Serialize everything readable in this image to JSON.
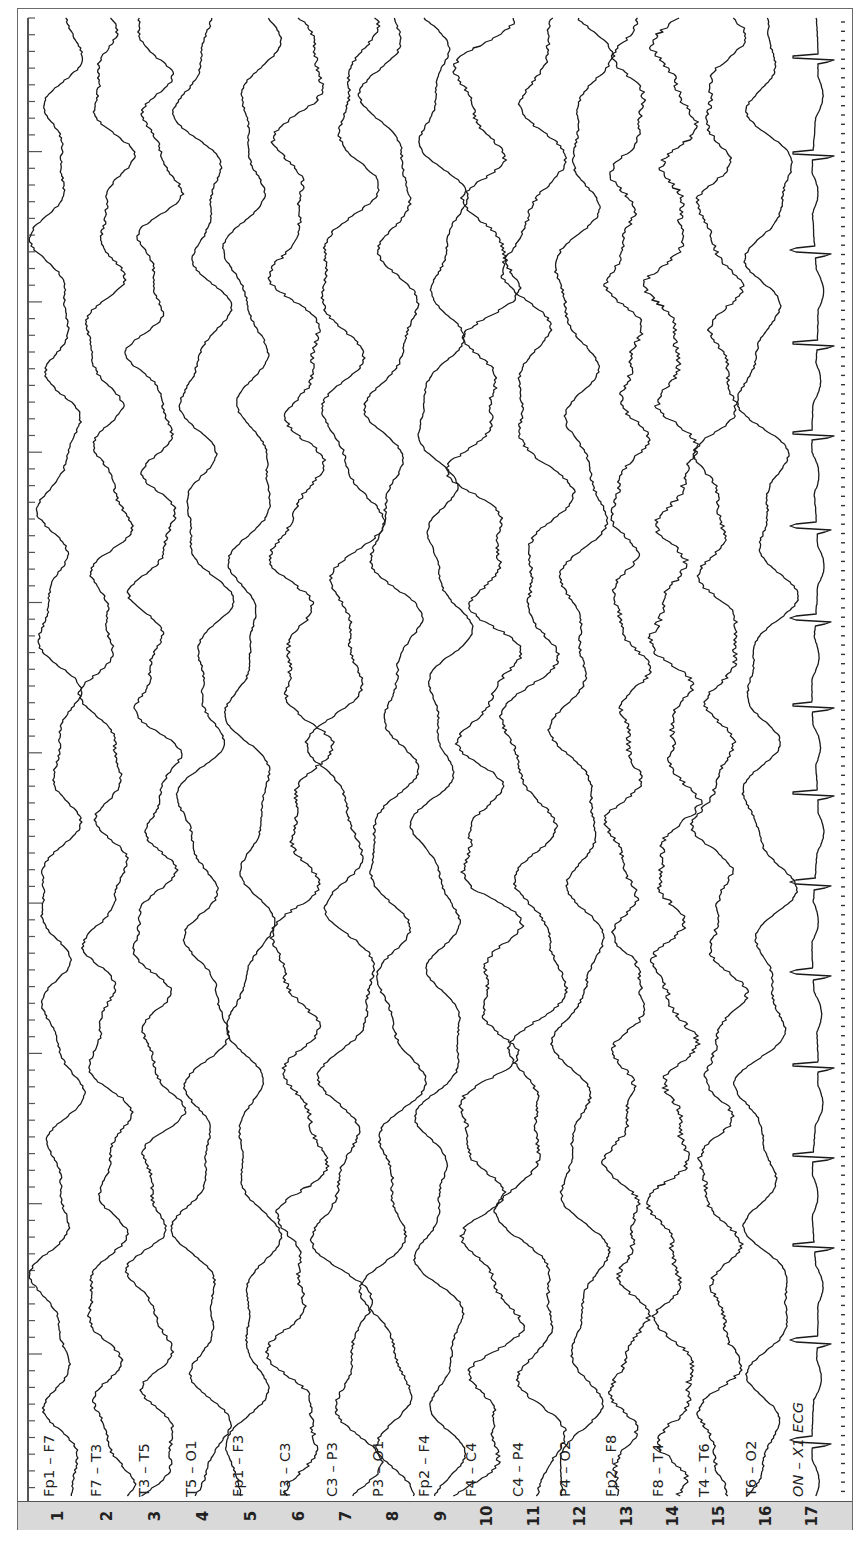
{
  "figure": {
    "type": "eeg_montage",
    "orientation": "rotated-90",
    "channel_count": 17
  },
  "chart_data": {
    "type": "line",
    "title": "",
    "xlabel": "",
    "ylabel": "",
    "legend": "channel labels at trace start (bottom), channel numbers in gray strip",
    "grid": false,
    "time_ruler": {
      "minor_tick_spacing_px": 16.7,
      "major_tick_every_px": 151
    },
    "series": [
      {
        "index": "1",
        "name": "Fp1 – F7",
        "baseline_x": 58,
        "amp": 14,
        "seed": 11,
        "noise": 1.2,
        "slow_period": 130
      },
      {
        "index": "2",
        "name": "F7 – T3",
        "baseline_x": 107,
        "amp": 14,
        "seed": 23,
        "noise": 1.6,
        "slow_period": 120
      },
      {
        "index": "3",
        "name": "T3 – T5",
        "baseline_x": 155,
        "amp": 15,
        "seed": 37,
        "noise": 1.6,
        "slow_period": 115
      },
      {
        "index": "4",
        "name": "T5 – O1",
        "baseline_x": 203,
        "amp": 16,
        "seed": 41,
        "noise": 1.2,
        "slow_period": 140
      },
      {
        "index": "5",
        "name": "Fp1 – F3",
        "baseline_x": 251,
        "amp": 15,
        "seed": 53,
        "noise": 1.0,
        "slow_period": 150
      },
      {
        "index": "6",
        "name": "F3 – C3",
        "baseline_x": 299,
        "amp": 17,
        "seed": 67,
        "noise": 2.2,
        "slow_period": 135
      },
      {
        "index": "7",
        "name": "C3 – P3",
        "baseline_x": 346,
        "amp": 20,
        "seed": 71,
        "noise": 1.6,
        "slow_period": 160
      },
      {
        "index": "8",
        "name": "P3 – O1",
        "baseline_x": 393,
        "amp": 17,
        "seed": 83,
        "noise": 1.3,
        "slow_period": 150
      },
      {
        "index": "9",
        "name": "Fp2 – F4",
        "baseline_x": 441,
        "amp": 16,
        "seed": 97,
        "noise": 1.0,
        "slow_period": 140
      },
      {
        "index": "10",
        "name": "F4 – C4",
        "baseline_x": 487,
        "amp": 20,
        "seed": 101,
        "noise": 2.2,
        "slow_period": 130
      },
      {
        "index": "11",
        "name": "C4 – P4",
        "baseline_x": 534,
        "amp": 20,
        "seed": 113,
        "noise": 1.8,
        "slow_period": 160
      },
      {
        "index": "12",
        "name": "P4 – O2",
        "baseline_x": 580,
        "amp": 16,
        "seed": 127,
        "noise": 1.4,
        "slow_period": 150
      },
      {
        "index": "13",
        "name": "Fp2 – F8",
        "baseline_x": 627,
        "amp": 12,
        "seed": 131,
        "noise": 2.4,
        "slow_period": 110
      },
      {
        "index": "14",
        "name": "F8 – T4",
        "baseline_x": 673,
        "amp": 14,
        "seed": 149,
        "noise": 3.0,
        "slow_period": 115
      },
      {
        "index": "15",
        "name": "T4 – T6",
        "baseline_x": 719,
        "amp": 14,
        "seed": 151,
        "noise": 2.2,
        "slow_period": 120
      },
      {
        "index": "16",
        "name": "T6 – O2",
        "baseline_x": 766,
        "amp": 17,
        "seed": 163,
        "noise": 1.0,
        "slow_period": 140
      },
      {
        "index": "17",
        "name": "ON – X1 ECG",
        "baseline_x": 815,
        "amp": 4,
        "seed": 173,
        "noise": 0.6,
        "slow_period": 90,
        "ecg": true,
        "qrs_y": [
          57,
          153,
          250,
          343,
          433,
          526,
          618,
          705,
          793,
          882,
          972,
          1065,
          1155,
          1245,
          1340,
          1440
        ]
      }
    ]
  },
  "strip": {
    "numbers": [
      "1",
      "2",
      "3",
      "4",
      "5",
      "6",
      "7",
      "8",
      "9",
      "10",
      "11",
      "12",
      "13",
      "14",
      "15",
      "16",
      "17"
    ]
  },
  "labels": {
    "ch1": "Fp1 – F7",
    "ch2": "F7 – T3",
    "ch3": "T3 – T5",
    "ch4": "T5 – O1",
    "ch5": "Fp1 – F3",
    "ch6": "F3 – C3",
    "ch7": "C3 – P3",
    "ch8": "P3 – O1",
    "ch9": "Fp2 – F4",
    "ch10": "F4 – C4",
    "ch11": "C4 – P4",
    "ch12": "P4 – O2",
    "ch13": "Fp2 – F8",
    "ch14": "F8 – T4",
    "ch15": "T4 – T6",
    "ch16": "T6 – O2",
    "ch17": "ON – X1 ECG"
  },
  "colors": {
    "trace": "#1a1a1a",
    "strip_bg": "#d9d9d9",
    "frame": "#6a6a6a"
  }
}
